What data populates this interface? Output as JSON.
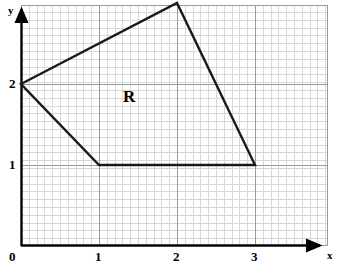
{
  "figure": {
    "width": 337,
    "height": 269,
    "background_color": "#ffffff"
  },
  "axes": {
    "x_axis_label": "x",
    "y_axis_label": "y",
    "axis_color": "#000000",
    "origin_px": {
      "x": 21,
      "y": 246
    },
    "unit_px": {
      "x": 78,
      "y": 81
    },
    "x_ticks": [
      {
        "label": "0",
        "value": 0,
        "px": 21
      },
      {
        "label": "1",
        "value": 1,
        "px": 99
      },
      {
        "label": "2",
        "value": 2,
        "px": 177
      },
      {
        "label": "3",
        "value": 3,
        "px": 255
      }
    ],
    "y_ticks": [
      {
        "label": "1",
        "value": 1,
        "px": 165
      },
      {
        "label": "2",
        "value": 2,
        "px": 84
      }
    ]
  },
  "grid": {
    "minor_spacing_px": 7.8,
    "minor_color": "#d8d8d8",
    "major_color": "#9a9a9a",
    "border_color": "#9a9a9a",
    "left_px": 21,
    "right_px": 328,
    "top_px": 5,
    "bottom_px": 246
  },
  "shape": {
    "label": "R",
    "label_position": {
      "x": 1.37,
      "y": 1.85
    },
    "stroke_color": "#1a1a1a",
    "stroke_width": 2.4,
    "fill": "none",
    "vertices": [
      {
        "x": 0,
        "y": 2
      },
      {
        "x": 2,
        "y": 3
      },
      {
        "x": 3,
        "y": 1
      },
      {
        "x": 1,
        "y": 1
      }
    ],
    "vertices_px": [
      {
        "x": 21,
        "y": 84
      },
      {
        "x": 177,
        "y": 3
      },
      {
        "x": 255,
        "y": 165
      },
      {
        "x": 99,
        "y": 165
      }
    ]
  }
}
